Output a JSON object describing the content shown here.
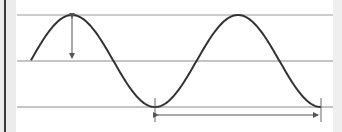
{
  "diagram": {
    "type": "sine-wave-anatomy",
    "colors": {
      "wave": "#333333",
      "reference_lines": "#8a8a8a",
      "arrows": "#555555",
      "left_rule": "#3a3a3a",
      "gutter": "#ececec",
      "right_margin": "#efefef"
    },
    "reference_lines": [
      {
        "name": "crest-line",
        "y": 15
      },
      {
        "name": "rest-line",
        "y": 61
      },
      {
        "name": "trough-line",
        "y": 107
      }
    ],
    "wave": {
      "start_x": 31,
      "end_x": 321,
      "midline_y": 61,
      "amplitude_px": 46,
      "wavelength_px": 166,
      "crests_x": [
        72,
        238
      ],
      "troughs_x": [
        155,
        321
      ]
    },
    "annotations": {
      "amplitude_arrow": {
        "x": 72,
        "y1": 15,
        "y2": 61
      },
      "wavelength_arrow": {
        "y": 115,
        "x1": 155,
        "x2": 321,
        "tick_top": 98,
        "tick_bottom": 122
      }
    }
  }
}
